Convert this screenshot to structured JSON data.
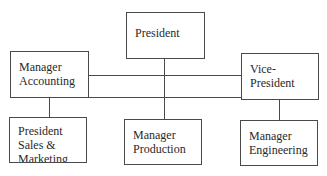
{
  "chart": {
    "type": "org-chart",
    "nodes": {
      "president": {
        "lines": [
          "President"
        ]
      },
      "manager_accounting": {
        "lines": [
          "Manager",
          "Accounting"
        ]
      },
      "vice_president": {
        "lines": [
          "Vice-",
          "President"
        ]
      },
      "president_sales_marketing": {
        "lines": [
          "President",
          "Sales &",
          "Marketing"
        ]
      },
      "manager_production": {
        "lines": [
          "Manager",
          "Production"
        ]
      },
      "manager_engineering": {
        "lines": [
          "Manager",
          "Engineering"
        ]
      }
    },
    "connections": [
      [
        "president",
        "manager_production"
      ],
      [
        "manager_accounting",
        "vice_president"
      ],
      [
        "manager_accounting",
        "president_sales_marketing"
      ],
      [
        "vice_president",
        "manager_engineering"
      ]
    ]
  }
}
